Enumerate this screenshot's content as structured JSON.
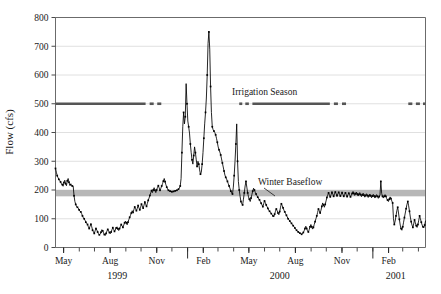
{
  "chart_data": {
    "type": "line",
    "title": "",
    "xlabel": "",
    "ylabel": "Flow (cfs)",
    "ylim": [
      0,
      800
    ],
    "ytick_values": [
      0,
      100,
      200,
      300,
      400,
      500,
      600,
      700,
      800
    ],
    "ytick_labels": [
      "0",
      "100",
      "200",
      "300",
      "400",
      "500",
      "600",
      "700",
      "800"
    ],
    "grid": "horizontal",
    "legend": "none",
    "x_axis": {
      "range_start": "1999-04-15",
      "range_end": "2001-04-15",
      "labeled_ticks": [
        {
          "label": "May",
          "date": "1999-05-01"
        },
        {
          "label": "Aug",
          "date": "1999-08-01"
        },
        {
          "label": "Nov",
          "date": "1999-11-01"
        },
        {
          "label": "Feb",
          "date": "2000-02-01"
        },
        {
          "label": "May",
          "date": "2000-05-01"
        },
        {
          "label": "Aug",
          "date": "2000-08-01"
        },
        {
          "label": "Nov",
          "date": "2000-11-01"
        },
        {
          "label": "Feb",
          "date": "2001-02-01"
        }
      ],
      "year_labels": [
        {
          "label": "1999",
          "date": "1999-08-15"
        },
        {
          "label": "2000",
          "date": "2000-07-01"
        },
        {
          "label": "2001",
          "date": "2001-02-15"
        }
      ],
      "year_dividers": [
        "2000-01-01",
        "2001-01-01"
      ]
    },
    "annotations": [
      {
        "name": "irrigation-season",
        "text": "Irrigation Season",
        "value": 500,
        "color": "#555555"
      },
      {
        "name": "winter-baseflow",
        "text": "Winter Baseflow",
        "value": 190,
        "band": [
          178,
          200
        ],
        "color": "#b3b3b3"
      }
    ],
    "irrigation_season_segments": [
      {
        "start": "1999-04-15",
        "end": "1999-10-10",
        "style": "solid"
      },
      {
        "start": "1999-10-18",
        "end": "1999-10-26",
        "style": "solid"
      },
      {
        "start": "1999-11-02",
        "end": "1999-11-10",
        "style": "solid"
      },
      {
        "start": "2000-04-12",
        "end": "2000-04-18",
        "style": "solid"
      },
      {
        "start": "2000-04-24",
        "end": "2000-05-01",
        "style": "solid"
      },
      {
        "start": "2000-05-08",
        "end": "2000-10-08",
        "style": "solid"
      },
      {
        "start": "2000-10-16",
        "end": "2000-10-24",
        "style": "solid"
      },
      {
        "start": "2000-11-01",
        "end": "2000-11-09",
        "style": "solid"
      },
      {
        "start": "2001-03-12",
        "end": "2001-03-20",
        "style": "solid"
      },
      {
        "start": "2001-03-27",
        "end": "2001-04-04",
        "style": "solid"
      },
      {
        "start": "2001-04-10",
        "end": "2001-04-15",
        "style": "solid"
      }
    ],
    "series": [
      {
        "name": "Flow",
        "color": "#000000",
        "marker": "square",
        "values": [
          275,
          262,
          250,
          243,
          237,
          233,
          228,
          222,
          219,
          213,
          226,
          234,
          222,
          215,
          232,
          240,
          227,
          216,
          219,
          214,
          214,
          213,
          180,
          160,
          150,
          142,
          140,
          137,
          131,
          126,
          124,
          118,
          110,
          104,
          100,
          95,
          88,
          84,
          80,
          72,
          66,
          74,
          81,
          72,
          60,
          55,
          49,
          58,
          66,
          61,
          54,
          48,
          44,
          47,
          53,
          62,
          58,
          51,
          45,
          42,
          49,
          57,
          63,
          58,
          52,
          48,
          54,
          62,
          69,
          63,
          56,
          61,
          68,
          72,
          65,
          59,
          66,
          73,
          80,
          75,
          70,
          78,
          86,
          92,
          86,
          79,
          88,
          97,
          105,
          112,
          120,
          128,
          122,
          132,
          141,
          135,
          128,
          136,
          146,
          138,
          131,
          140,
          151,
          144,
          137,
          147,
          158,
          150,
          143,
          153,
          164,
          172,
          181,
          190,
          198,
          191,
          200,
          208,
          199,
          191,
          200,
          209,
          215,
          207,
          199,
          206,
          214,
          222,
          231,
          240,
          229,
          218,
          210,
          203,
          199,
          197,
          196,
          195,
          194,
          194,
          195,
          196,
          197,
          198,
          199,
          200,
          203,
          207,
          214,
          240,
          330,
          420,
          470,
          430,
          455,
          570,
          500,
          440,
          420,
          398,
          360,
          330,
          305,
          290,
          320,
          350,
          330,
          305,
          282,
          300,
          290,
          270,
          255,
          262,
          290,
          330,
          380,
          430,
          470,
          520,
          600,
          710,
          750,
          690,
          560,
          470,
          420,
          410,
          405,
          400,
          392,
          380,
          366,
          350,
          340,
          332,
          322,
          308,
          294,
          280,
          266,
          252,
          244,
          238,
          230,
          222,
          214,
          206,
          196,
          190,
          186,
          210,
          250,
          300,
          360,
          430,
          300,
          230,
          200,
          178,
          160,
          152,
          148,
          168,
          190,
          214,
          230,
          210,
          190,
          176,
          168,
          160,
          172,
          184,
          196,
          206,
          200,
          192,
          186,
          180,
          175,
          170,
          166,
          160,
          154,
          148,
          142,
          152,
          162,
          156,
          148,
          142,
          136,
          130,
          126,
          122,
          118,
          114,
          110,
          106,
          116,
          126,
          134,
          128,
          120,
          114,
          125,
          140,
          152,
          146,
          138,
          130,
          124,
          118,
          112,
          106,
          100,
          96,
          92,
          88,
          84,
          80,
          76,
          72,
          68,
          64,
          60,
          57,
          54,
          52,
          50,
          48,
          46,
          48,
          52,
          58,
          66,
          74,
          66,
          58,
          54,
          62,
          72,
          80,
          72,
          64,
          70,
          80,
          90,
          100,
          110,
          122,
          134,
          128,
          120,
          130,
          143,
          155,
          148,
          140,
          150,
          162,
          174,
          182,
          190,
          183,
          176,
          184,
          192,
          186,
          178,
          186,
          193,
          187,
          180,
          186,
          192,
          186,
          179,
          185,
          191,
          185,
          178,
          184,
          190,
          184,
          177,
          183,
          189,
          183,
          176,
          182,
          188,
          195,
          188,
          181,
          187,
          193,
          186,
          179,
          185,
          191,
          184,
          177,
          183,
          189,
          182,
          175,
          181,
          187,
          181,
          174,
          180,
          186,
          180,
          173,
          179,
          185,
          179,
          172,
          178,
          184,
          178,
          171,
          177,
          183,
          230,
          188,
          178,
          172,
          178,
          184,
          178,
          170,
          165,
          160,
          168,
          176,
          170,
          162,
          155,
          100,
          80,
          92,
          110,
          128,
          140,
          120,
          98,
          78,
          66,
          60,
          72,
          88,
          104,
          120,
          135,
          150,
          160,
          145,
          126,
          106,
          90,
          78,
          70,
          82,
          96,
          86,
          76,
          70,
          80,
          95,
          110,
          100,
          88,
          78,
          72,
          68,
          78,
          92
        ]
      }
    ]
  }
}
